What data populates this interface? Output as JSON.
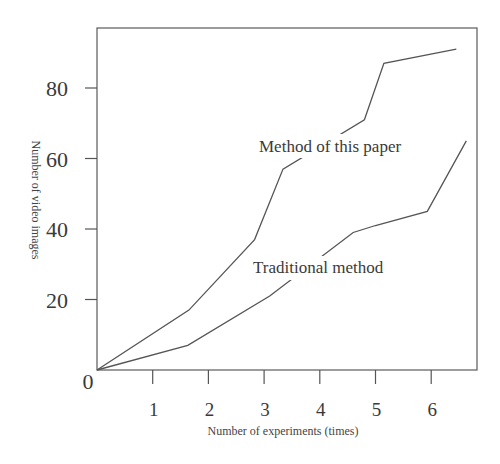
{
  "chart_data": {
    "type": "line",
    "title": "",
    "xlabel": "Number of experiments (times)",
    "ylabel": "Number of video images",
    "x_ticks": [
      "1",
      "2",
      "3",
      "4",
      "5",
      "6"
    ],
    "y_ticks": [
      "0",
      "20",
      "40",
      "60",
      "80"
    ],
    "xlim": [
      0,
      6.9
    ],
    "ylim": [
      0,
      97
    ],
    "grid": false,
    "legend": "inline labels",
    "series": [
      {
        "name": "Method of this paper",
        "points": [
          [
            0,
            0
          ],
          [
            1.65,
            17
          ],
          [
            2.83,
            37
          ],
          [
            3.34,
            57
          ],
          [
            4.8,
            71
          ],
          [
            5.15,
            87
          ],
          [
            6.45,
            91
          ]
        ]
      },
      {
        "name": "Traditional method",
        "points": [
          [
            0,
            0
          ],
          [
            1.63,
            7
          ],
          [
            3.1,
            21
          ],
          [
            4.6,
            39
          ],
          [
            5.0,
            41
          ],
          [
            5.93,
            45
          ],
          [
            6.63,
            65
          ]
        ]
      }
    ]
  },
  "labels": {
    "origin": "0",
    "series1": "Method of this paper",
    "series2": "Traditional method"
  },
  "colors": {
    "line": "#555555",
    "axis": "#555555",
    "text": "#3a3a3a"
  }
}
